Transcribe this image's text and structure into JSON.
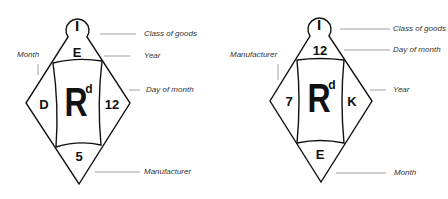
{
  "diagrams": [
    {
      "id": "left",
      "circle_top": "I",
      "top_cell": "E",
      "left_cell": "D",
      "center_mark": "R",
      "center_superscript": "d",
      "right_cell": "12",
      "bottom_cell": "5",
      "labels": {
        "circle_top": "Class of goods",
        "top_cell": "Year",
        "left_cell": "Month",
        "right_cell": "Day of month",
        "bottom_cell": "Manufacturer"
      }
    },
    {
      "id": "right",
      "circle_top": "I",
      "top_cell": "12",
      "left_cell": "7",
      "center_mark": "R",
      "center_superscript": "d",
      "right_cell": "K",
      "bottom_cell": "E",
      "labels": {
        "circle_top": "Class of goods",
        "top_cell": "Day of month",
        "left_cell": "Manufacturer",
        "right_cell": "Year",
        "bottom_cell": "Month"
      }
    }
  ],
  "colors": {
    "line": "#111111",
    "leader": "#777777",
    "label_text": "#333333",
    "background": "#ffffff"
  }
}
